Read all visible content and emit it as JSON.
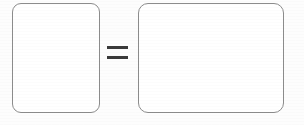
{
  "diagram": {
    "type": "equation-diagram",
    "background_color": "#fdfdfd",
    "stroke_color": "#8c8c8c",
    "fill_color": "#ffffff",
    "operator_color": "#3a3a3a",
    "shapes": [
      {
        "id": "left-box",
        "name": "left-rounded-rectangle",
        "label": "",
        "x": 12,
        "y": 3,
        "width": 88,
        "height": 110,
        "corner_radius": 9
      },
      {
        "id": "right-box",
        "name": "right-rounded-rectangle",
        "label": "",
        "x": 138,
        "y": 3,
        "width": 146,
        "height": 110,
        "corner_radius": 10
      }
    ],
    "operator": {
      "name": "equals-sign",
      "symbol": "=",
      "x": 107,
      "y": 46,
      "width": 21,
      "height": 13,
      "bar_count": 2,
      "bar_thickness": 3
    }
  }
}
